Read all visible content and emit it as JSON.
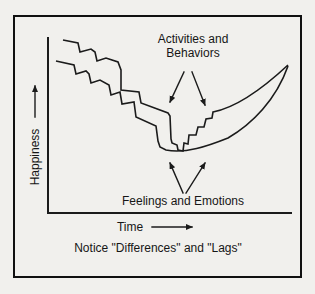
{
  "labels": {
    "activities_line1": "Activities and",
    "activities_line2": "Behaviors",
    "feelings": "Feelings and Emotions",
    "y_axis": "Happiness",
    "x_axis": "Time",
    "caption": "Notice \"Differences\" and \"Lags\""
  },
  "colors": {
    "ink": "#1b1b1b",
    "paper": "#f1f0ed"
  },
  "chart_data": {
    "type": "line",
    "title": "",
    "xlabel": "Time",
    "ylabel": "Happiness",
    "axes_numeric": false,
    "qualitative": true,
    "grid": false,
    "legend": "none",
    "annotations": [
      {
        "text": "Activities and Behaviors",
        "position": "top center",
        "arrows": "two arrows point down to the jagged line around its minimum"
      },
      {
        "text": "Feelings and Emotions",
        "position": "below the curve minimum",
        "arrows": "two arrows point up to both lines at the minimum"
      }
    ],
    "pixel_geometry": {
      "y_axis": {
        "x1": 48,
        "y1": 38,
        "x2": 48,
        "y2": 213
      },
      "x_axis": {
        "x1": 48,
        "y1": 213,
        "x2": 291,
        "y2": 213
      },
      "series": [
        {
          "name": "Activities and Behaviors",
          "shape": "jagged staircase down, stepped rise, near-straight climb to tip",
          "path": "M63 40 L78 43 L80 52 L91 49 L95 52 L97 61 L106 58 L118 62 L121 70 L121 90 L139 92 L141 103 L168 113 L170 116 L171 139 L172 143 L177 145 L178 150 L183 151 L184 143 L188 144 L189 135 L196 135 L198 127 L204 127 L206 119 L212 118 L213 112 Q244 106 288 65"
        },
        {
          "name": "Feelings and Emotions",
          "shape": "lagging staircase down, smooth concave-up recovery to tip",
          "path": "M56 61 L74 65 L76 74 L86 71 L89 74 L91 83 L100 80 L109 85 L111 95 L120 92 L122 104 L134 102 L136 117 L156 126 L158 141 L160 147 L166 150 C185 154 208 146 228 138 C252 124 276 100 288 66"
        }
      ],
      "annotation_arrows": [
        {
          "x1": 184,
          "y1": 72,
          "x2": 170,
          "y2": 102
        },
        {
          "x1": 192,
          "y1": 72,
          "x2": 205,
          "y2": 105
        },
        {
          "x1": 183,
          "y1": 193,
          "x2": 170,
          "y2": 163
        },
        {
          "x1": 186,
          "y1": 193,
          "x2": 205,
          "y2": 163
        }
      ],
      "axis_arrows": [
        {
          "name": "happiness-up-arrow",
          "x1": 35,
          "y1": 117,
          "x2": 35,
          "y2": 86
        },
        {
          "name": "time-right-arrow",
          "x1": 152,
          "y1": 227,
          "x2": 192,
          "y2": 227
        }
      ]
    }
  }
}
